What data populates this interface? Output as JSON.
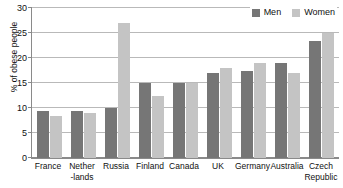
{
  "chart_data": {
    "type": "bar",
    "title": "",
    "subtitle": "",
    "xlabel": "",
    "ylabel": "% of obese people",
    "ylim": [
      0,
      30
    ],
    "ytick_step": 5,
    "yticks": [
      0,
      5,
      10,
      15,
      20,
      25,
      30
    ],
    "ytick_labels": [
      "0",
      "5",
      "10",
      "15",
      "20",
      "25",
      "30"
    ],
    "grid": true,
    "legend_position": "top-right",
    "categories": [
      "France",
      "Nether\n-lands",
      "Russia",
      "Finland",
      "Canada",
      "UK",
      "Germany",
      "Australia",
      "Czech\nRepublic"
    ],
    "series": [
      {
        "name": "Men",
        "color": "#767676",
        "values": [
          9.5,
          9.5,
          10.0,
          15.0,
          15.0,
          17.0,
          17.5,
          19.0,
          23.5
        ]
      },
      {
        "name": "Women",
        "color": "#c4c4c4",
        "values": [
          8.5,
          9.0,
          27.0,
          12.5,
          15.0,
          18.0,
          19.0,
          17.0,
          25.0
        ]
      }
    ]
  },
  "legend": {
    "items": [
      {
        "label": "Men",
        "swatch": "men-swatch"
      },
      {
        "label": "Women",
        "swatch": "women-swatch"
      }
    ]
  }
}
